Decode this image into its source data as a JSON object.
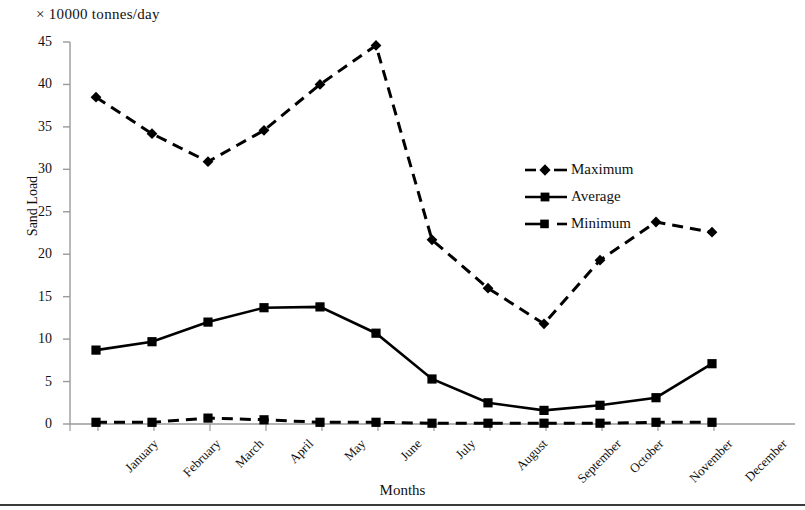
{
  "chart_data": {
    "type": "line",
    "title": "× 10000  tonnes/day",
    "xlabel": "Months",
    "ylabel": "Sand Load",
    "ylim": [
      0,
      45
    ],
    "yticks": [
      0,
      5,
      10,
      15,
      20,
      25,
      30,
      35,
      40,
      45
    ],
    "grid": false,
    "legend_position": "inside-right",
    "categories": [
      "January",
      "February",
      "March",
      "April",
      "May",
      "June",
      "July",
      "August",
      "September",
      "October",
      "November",
      "December"
    ],
    "series": [
      {
        "name": "Maximum",
        "marker": "diamond",
        "line_style": "dashed",
        "color": "#000000",
        "values": [
          38.5,
          34.2,
          30.9,
          34.6,
          40.0,
          44.6,
          21.7,
          16.0,
          11.8,
          19.3,
          23.8,
          22.6
        ]
      },
      {
        "name": "Average",
        "marker": "square",
        "line_style": "solid",
        "color": "#000000",
        "values": [
          8.7,
          9.7,
          12.0,
          13.7,
          13.8,
          10.7,
          5.3,
          2.5,
          1.6,
          2.2,
          3.1,
          7.1
        ]
      },
      {
        "name": "Minimum",
        "marker": "square",
        "line_style": "dashed",
        "color": "#000000",
        "values": [
          0.2,
          0.2,
          0.7,
          0.5,
          0.2,
          0.2,
          0.1,
          0.1,
          0.1,
          0.1,
          0.2,
          0.2
        ]
      }
    ]
  },
  "legend": {
    "items": [
      {
        "label": "Maximum"
      },
      {
        "label": "Average"
      },
      {
        "label": "Minimum"
      }
    ]
  }
}
